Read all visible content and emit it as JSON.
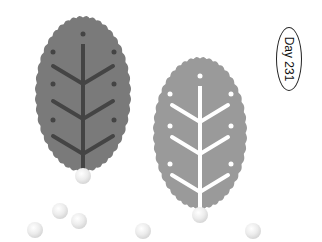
{
  "badge": {
    "label": "Day 231"
  },
  "leaves": [
    {
      "name": "dark-leaf",
      "cx": 83,
      "cy": 94,
      "rx": 48,
      "ry": 78,
      "fill": "#7a7a7a",
      "vein": "#444444",
      "stem_top": 44,
      "stem_bottom": 172,
      "branches": [
        {
          "y": 66,
          "arm": 30,
          "dy": 18
        },
        {
          "y": 101,
          "arm": 30,
          "dy": 18
        },
        {
          "y": 136,
          "arm": 30,
          "dy": 18
        }
      ],
      "dots": [
        [
          83,
          34
        ],
        [
          53,
          52
        ],
        [
          114,
          52
        ],
        [
          53,
          84
        ],
        [
          114,
          84
        ],
        [
          53,
          120
        ],
        [
          114,
          120
        ]
      ]
    },
    {
      "name": "light-leaf",
      "cx": 200,
      "cy": 133,
      "rx": 47,
      "ry": 76,
      "fill": "#9a9a9a",
      "vein": "#ffffff",
      "stem_top": 86,
      "stem_bottom": 210,
      "branches": [
        {
          "y": 105,
          "arm": 28,
          "dy": 17
        },
        {
          "y": 137,
          "arm": 28,
          "dy": 17
        },
        {
          "y": 175,
          "arm": 28,
          "dy": 17
        }
      ],
      "dots": [
        [
          200,
          76
        ],
        [
          170,
          94
        ],
        [
          231,
          94
        ],
        [
          170,
          126
        ],
        [
          231,
          126
        ],
        [
          170,
          164
        ],
        [
          231,
          164
        ]
      ]
    }
  ],
  "balls": [
    [
      83,
      176
    ],
    [
      200,
      215
    ],
    [
      35,
      230
    ],
    [
      60,
      211
    ],
    [
      79,
      221
    ],
    [
      143,
      231
    ],
    [
      253,
      231
    ]
  ]
}
